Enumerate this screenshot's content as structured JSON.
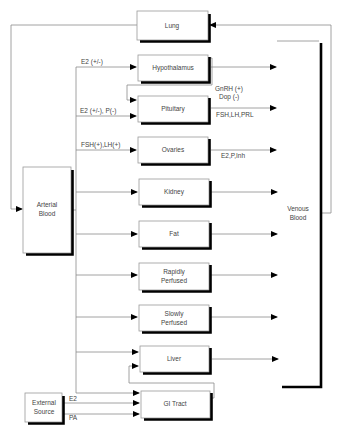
{
  "diagram": {
    "type": "pbpk-compartment-model",
    "compartments": {
      "lung": "Lung",
      "hypothalamus": "Hypothalamus",
      "pituitary": "Pituitary",
      "ovaries": "Ovaries",
      "kidney": "Kidney",
      "fat": "Fat",
      "rapidly_perfused": [
        "Rapidly",
        "Perfused"
      ],
      "slowly_perfused": [
        "Slowly",
        "Perfused"
      ],
      "liver": "Liver",
      "gi_tract": "GI Tract",
      "arterial_blood": [
        "Arterial",
        "Blood"
      ],
      "venous_blood": [
        "Venous",
        "Blood"
      ],
      "external_source": [
        "External",
        "Source"
      ]
    },
    "edge_labels": {
      "hypothalamus_input": "E2 (+/-)",
      "pituitary_input": "E2 (+/-), P(-)",
      "hypothalamus_to_pituitary": [
        "GnRH (+)",
        "Dop (-)"
      ],
      "pituitary_output": "FSH,LH,PRL",
      "ovaries_input": "FSH(+),LH(+)",
      "ovaries_output": "E2,P,Inh",
      "external_e2": "E2",
      "external_pa": "PA"
    },
    "colors": {
      "line": "#8a8a8a",
      "shadow": "#000000",
      "text": "#444444"
    }
  }
}
